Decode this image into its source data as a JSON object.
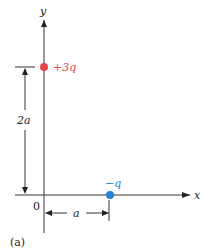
{
  "diagram": {
    "axes": {
      "x_label": "x",
      "y_label": "y",
      "origin_label": "0"
    },
    "charges": [
      {
        "label": "+3q",
        "color": "#e8434a",
        "position": "on y-axis at height 2a"
      },
      {
        "label": "−q",
        "color": "#2a7fd4",
        "position": "on x-axis at distance a"
      }
    ],
    "dimensions": {
      "vertical": "2a",
      "horizontal": "a"
    },
    "caption": "(a)"
  }
}
